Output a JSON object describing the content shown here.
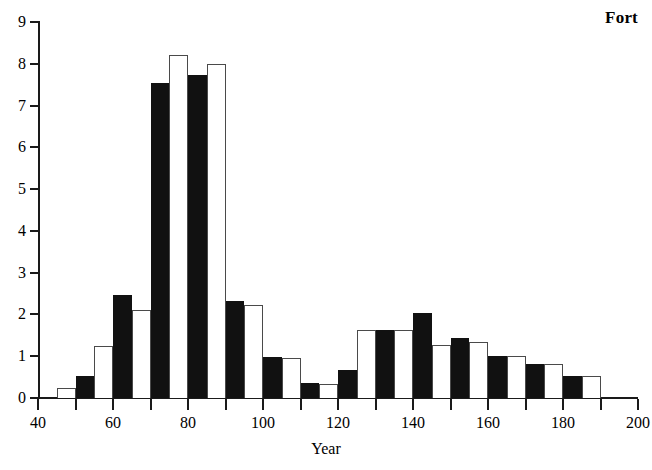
{
  "title": "Fort",
  "axis": {
    "x_label": "Year",
    "y_label": "",
    "x_ticks": [
      "40",
      "60",
      "80",
      "100",
      "120",
      "140",
      "160",
      "180",
      "200"
    ],
    "y_ticks": [
      "0",
      "1",
      "2",
      "3",
      "4",
      "5",
      "6",
      "7",
      "8",
      "9"
    ]
  },
  "bottom_caption": "",
  "colors": {
    "series_a": "#ffffff",
    "series_b": "#111111",
    "axis": "#1a1a1a"
  },
  "chart_data": {
    "type": "bar",
    "title": "Fort",
    "xlabel": "Year",
    "ylabel": "",
    "xlim": [
      40,
      200
    ],
    "ylim": [
      0,
      9
    ],
    "x_tick_step": 20,
    "x_minor_tick_step": 10,
    "y_tick_step": 1,
    "grid": false,
    "legend": false,
    "bin_width": 5,
    "note": "Histogram of two interleaved series drawn as alternating white-outlined and solid black bars, each 5 year-units wide, spanning 45 to 190.",
    "bins": [
      {
        "start": 45,
        "end": 50,
        "value": 0.25,
        "fill": "white"
      },
      {
        "start": 50,
        "end": 55,
        "value": 0.52,
        "fill": "black"
      },
      {
        "start": 55,
        "end": 60,
        "value": 1.25,
        "fill": "white"
      },
      {
        "start": 60,
        "end": 65,
        "value": 2.47,
        "fill": "black"
      },
      {
        "start": 65,
        "end": 70,
        "value": 2.1,
        "fill": "white"
      },
      {
        "start": 70,
        "end": 75,
        "value": 7.55,
        "fill": "black"
      },
      {
        "start": 75,
        "end": 80,
        "value": 8.2,
        "fill": "white"
      },
      {
        "start": 80,
        "end": 85,
        "value": 7.73,
        "fill": "black"
      },
      {
        "start": 85,
        "end": 90,
        "value": 8.0,
        "fill": "white"
      },
      {
        "start": 90,
        "end": 95,
        "value": 2.33,
        "fill": "black"
      },
      {
        "start": 95,
        "end": 100,
        "value": 2.22,
        "fill": "white"
      },
      {
        "start": 100,
        "end": 105,
        "value": 0.97,
        "fill": "black"
      },
      {
        "start": 105,
        "end": 110,
        "value": 0.95,
        "fill": "white"
      },
      {
        "start": 110,
        "end": 115,
        "value": 0.35,
        "fill": "black"
      },
      {
        "start": 115,
        "end": 120,
        "value": 0.34,
        "fill": "white"
      },
      {
        "start": 120,
        "end": 125,
        "value": 0.67,
        "fill": "black"
      },
      {
        "start": 125,
        "end": 130,
        "value": 1.62,
        "fill": "white"
      },
      {
        "start": 130,
        "end": 135,
        "value": 1.62,
        "fill": "black"
      },
      {
        "start": 135,
        "end": 140,
        "value": 1.62,
        "fill": "white"
      },
      {
        "start": 140,
        "end": 145,
        "value": 2.03,
        "fill": "black"
      },
      {
        "start": 145,
        "end": 150,
        "value": 1.28,
        "fill": "white"
      },
      {
        "start": 150,
        "end": 155,
        "value": 1.44,
        "fill": "black"
      },
      {
        "start": 155,
        "end": 160,
        "value": 1.34,
        "fill": "white"
      },
      {
        "start": 160,
        "end": 165,
        "value": 1.0,
        "fill": "black"
      },
      {
        "start": 165,
        "end": 170,
        "value": 1.0,
        "fill": "white"
      },
      {
        "start": 170,
        "end": 175,
        "value": 0.82,
        "fill": "black"
      },
      {
        "start": 175,
        "end": 180,
        "value": 0.81,
        "fill": "white"
      },
      {
        "start": 180,
        "end": 185,
        "value": 0.52,
        "fill": "black"
      },
      {
        "start": 185,
        "end": 190,
        "value": 0.52,
        "fill": "white"
      }
    ]
  }
}
